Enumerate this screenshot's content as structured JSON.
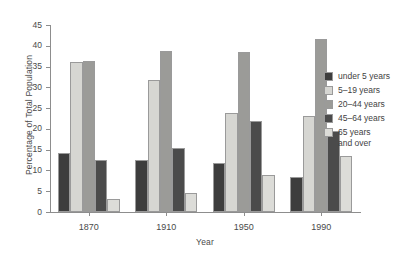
{
  "chart_data": {
    "type": "bar",
    "title": "",
    "xlabel": "Year",
    "ylabel": "Percentage of Total Population",
    "categories": [
      "1870",
      "1910",
      "1950",
      "1990"
    ],
    "ylim": [
      0,
      45
    ],
    "yticks": [
      0,
      5,
      10,
      15,
      20,
      25,
      30,
      35,
      40,
      45
    ],
    "grid": false,
    "legend_position": "right",
    "series": [
      {
        "name": "under 5 years",
        "color": "#3d3d3d",
        "values": [
          14.3,
          12.5,
          11.9,
          8.5
        ]
      },
      {
        "name": "5–19 years",
        "color": "#d6d6d2",
        "values": [
          36.2,
          31.7,
          23.8,
          23.0
        ]
      },
      {
        "name": "20–44 years",
        "color": "#9b9b98",
        "values": [
          36.3,
          38.7,
          38.4,
          41.7
        ]
      },
      {
        "name": "45–64 years",
        "color": "#4b4b4b",
        "values": [
          12.6,
          15.3,
          21.9,
          19.6
        ]
      },
      {
        "name": "65 years\nand over",
        "color": "#dcdcd8",
        "values": [
          3.2,
          4.6,
          8.9,
          13.4
        ]
      }
    ]
  },
  "legend": {
    "items": [
      {
        "label": "under 5 years",
        "swatch": "#3d3d3d"
      },
      {
        "label": "5–19 years",
        "swatch": "#d6d6d2"
      },
      {
        "label": "20–44 years",
        "swatch": "#9b9b98"
      },
      {
        "label": "45–64 years",
        "swatch": "#4b4b4b"
      },
      {
        "label": "65 years\nand over",
        "swatch": "#dcdcd8"
      }
    ]
  },
  "axes": {
    "y_title": "Percentage of Total Population",
    "x_title": "Year"
  }
}
